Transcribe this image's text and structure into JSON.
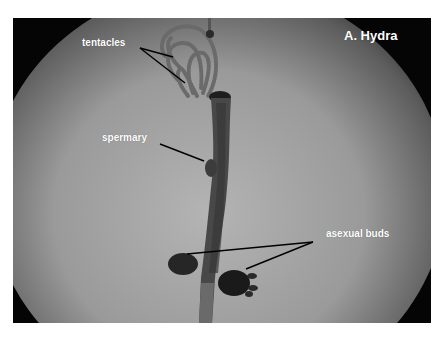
{
  "figure": {
    "title": "A. Hydra",
    "labels": [
      {
        "id": "tentacles",
        "text": "tentacles"
      },
      {
        "id": "spermary",
        "text": "spermary"
      },
      {
        "id": "asexual_buds",
        "text": "asexual buds"
      }
    ]
  },
  "colors": {
    "background": "#ffffff",
    "label_text": "#ffffff",
    "pointer_line": "#000000"
  }
}
